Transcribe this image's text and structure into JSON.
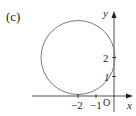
{
  "figure": {
    "panel_label": "(c)",
    "x_axis_label": "x",
    "y_axis_label": "y",
    "origin_label": "O",
    "x_ticks": [
      "−2",
      "−1"
    ],
    "y_ticks": [
      "1",
      "2"
    ],
    "shape": "circle",
    "circle": {
      "center": [
        -2,
        2
      ],
      "radius": 2
    },
    "colors": {
      "curve": "#7a7a7a",
      "axes": "#231f20"
    }
  }
}
